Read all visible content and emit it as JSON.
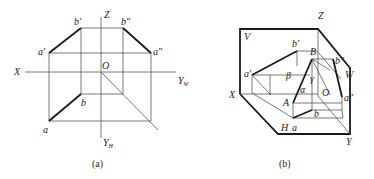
{
  "panel_a": {
    "caption": "(a)",
    "labels": {
      "Z": "Z",
      "X": "X",
      "O": "O",
      "YW": "Y",
      "YW_sub": "W",
      "YH": "Y",
      "YH_sub": "H",
      "a_prime": "a′",
      "b_prime": "b′",
      "a_dprime": "a″",
      "b_dprime": "b″",
      "a": "a",
      "b": "b"
    }
  },
  "panel_b": {
    "caption": "(b)",
    "labels": {
      "Z": "Z",
      "X": "X",
      "Y": "Y",
      "O": "O",
      "V": "V",
      "W": "W",
      "H": "H",
      "A": "A",
      "B": "B",
      "a_prime": "a′",
      "b_prime": "b′",
      "a_dprime": "a″",
      "b_dprime": "b″",
      "a": "a",
      "b": "b",
      "alpha": "α",
      "beta": "β",
      "gamma": "γ"
    }
  }
}
